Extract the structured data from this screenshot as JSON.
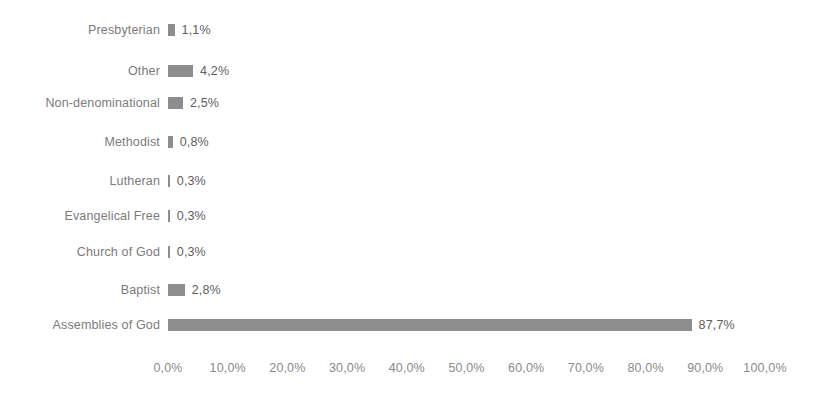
{
  "chart_data": {
    "type": "bar",
    "orientation": "horizontal",
    "title": "",
    "subtitle": "",
    "xlabel": "",
    "ylabel": "",
    "xlim": [
      0,
      100
    ],
    "grid": false,
    "legend": false,
    "bar_color": "#8d8d8d",
    "background_color": "#ffffff",
    "decimal_separator": ",",
    "categories": [
      "Presbyterian",
      "Other",
      "Non-denominational",
      "Methodist",
      "Lutheran",
      "Evangelical Free",
      "Church of God",
      "Baptist",
      "Assemblies of God"
    ],
    "values": [
      1.1,
      4.2,
      2.5,
      0.8,
      0.3,
      0.3,
      0.3,
      2.8,
      87.7
    ],
    "value_labels": [
      "1,1%",
      "4,2%",
      "2,5%",
      "0,8%",
      "0,3%",
      "0,3%",
      "0,3%",
      "2,8%",
      "87,7%"
    ],
    "xticks": [
      0,
      10,
      20,
      30,
      40,
      50,
      60,
      70,
      80,
      90,
      100
    ],
    "xtick_labels": [
      "0,0%",
      "10,0%",
      "20,0%",
      "30,0%",
      "40,0%",
      "50,0%",
      "60,0%",
      "70,0%",
      "80,0%",
      "90,0%",
      "100,0%"
    ]
  },
  "layout": {
    "plot_left": 168,
    "plot_right": 765,
    "row_centers": [
      30,
      71,
      103,
      142,
      181,
      216,
      252,
      290,
      325
    ],
    "axis_y": 368
  }
}
